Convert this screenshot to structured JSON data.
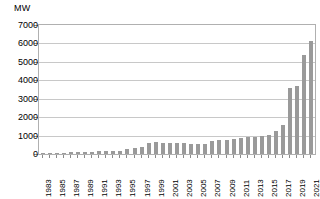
{
  "chart_data": {
    "type": "bar",
    "title": "",
    "subtitle": "",
    "xlabel": "",
    "ylabel": "MW",
    "ylim": [
      0,
      7000
    ],
    "ytick_step": 1000,
    "yticks": [
      7000,
      6000,
      5000,
      4000,
      3000,
      2000,
      1000,
      0
    ],
    "ytick_labels": [
      "7000",
      "6000",
      "5000",
      "4000",
      "3000",
      "2000",
      "1000",
      "0"
    ],
    "grid": "horizontal",
    "legend": "none",
    "bar_color": "#9a9a9a",
    "gridline_color": "#c8c8c8",
    "plot_border_color": "#b0b0b0",
    "background_color": "#ffffff",
    "xtick_label_rotation": -90,
    "xtick_label_interval": 2,
    "categories": [
      "1983",
      "1984",
      "1985",
      "1986",
      "1987",
      "1988",
      "1989",
      "1990",
      "1991",
      "1992",
      "1993",
      "1994",
      "1995",
      "1996",
      "1997",
      "1998",
      "1999",
      "2000",
      "2001",
      "2002",
      "2003",
      "2004",
      "2005",
      "2006",
      "2007",
      "2008",
      "2009",
      "2010",
      "2011",
      "2012",
      "2013",
      "2014",
      "2015",
      "2016",
      "2017",
      "2018",
      "2019",
      "2020",
      "2021"
    ],
    "xtick_labels_shown": [
      "1983",
      "1985",
      "1987",
      "1989",
      "1991",
      "1993",
      "1995",
      "1997",
      "1999",
      "2001",
      "2003",
      "2005",
      "2007",
      "2009",
      "2011",
      "2013",
      "2015",
      "2017",
      "2019",
      "2021"
    ],
    "values": [
      10,
      15,
      20,
      30,
      90,
      110,
      120,
      130,
      140,
      150,
      160,
      190,
      260,
      330,
      400,
      620,
      640,
      620,
      600,
      600,
      580,
      560,
      540,
      560,
      700,
      750,
      780,
      830,
      860,
      900,
      950,
      1000,
      1050,
      1250,
      1550,
      3600,
      3700,
      5400,
      6150
    ]
  }
}
